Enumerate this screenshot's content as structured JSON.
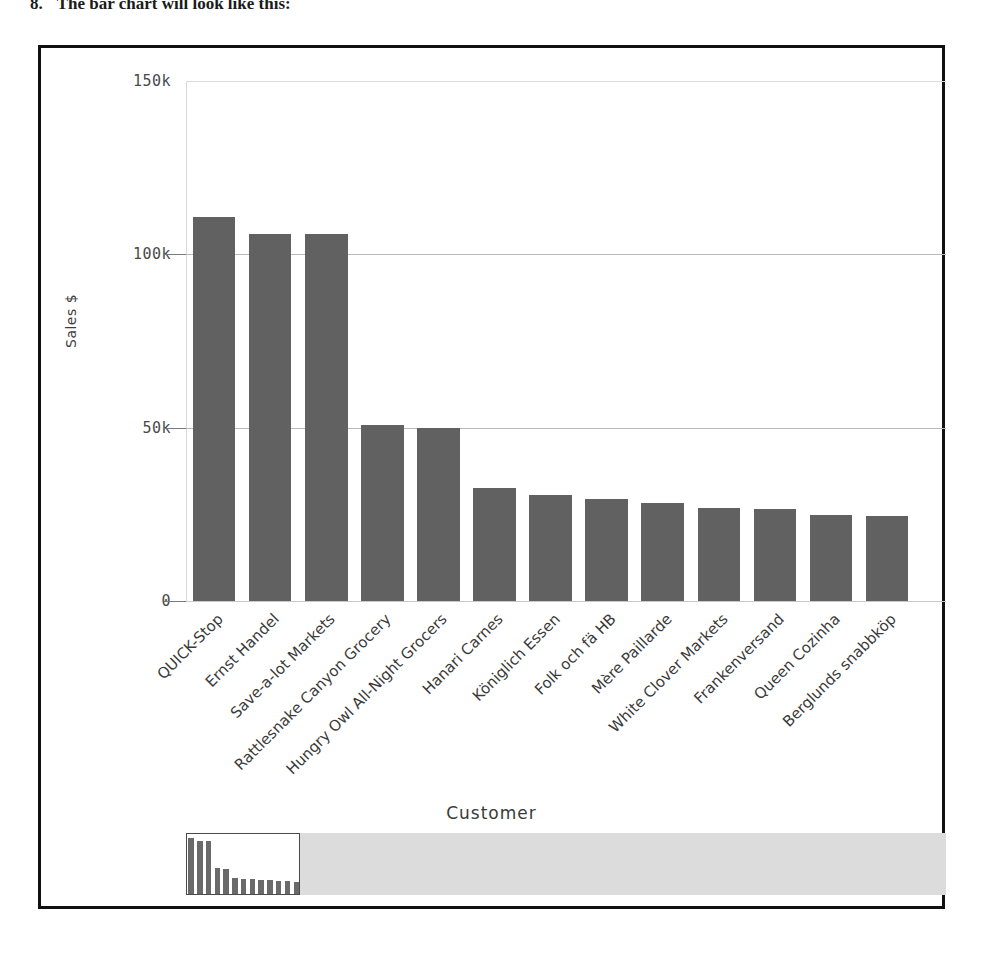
{
  "caption": {
    "number": "8.",
    "text": "The bar chart will look like this:"
  },
  "chart_data": {
    "type": "bar",
    "title": "",
    "xlabel": "Customer",
    "ylabel": "Sales $",
    "ylim": [
      0,
      150000
    ],
    "grid": true,
    "legend": "none",
    "ytick_labels": [
      "150k",
      "100k",
      "50k",
      "0"
    ],
    "ytick_values": [
      150000,
      100000,
      50000,
      0
    ],
    "bar_color": "#616161",
    "categories": [
      "QUICK-Stop",
      "Ernst Handel",
      "Save-a-lot Markets",
      "Rattlesnake Canyon Grocery",
      "Hungry Owl All-Night Grocers",
      "Hanari Carnes",
      "Königlich Essen",
      "Folk och fä HB",
      "Mère Paillarde",
      "White Clover Markets",
      "Frankenversand",
      "Queen Cozinha",
      "Berglunds snabbköp"
    ],
    "values": [
      110900,
      105900,
      105900,
      50800,
      49800,
      32700,
      30500,
      29300,
      28400,
      26800,
      26500,
      24900,
      24600
    ]
  },
  "range_selector": {
    "window_start_pct": 0,
    "window_end_pct": 15,
    "overview_values": [
      110900,
      105900,
      105900,
      50800,
      49800,
      32700,
      30500,
      29300,
      28400,
      26800,
      26500,
      24900,
      24600,
      24000,
      23500,
      23000,
      22400,
      21900,
      21300,
      20800,
      20200,
      19700,
      19100,
      18600,
      18000,
      17500,
      17000,
      16500,
      16000,
      15600,
      15100,
      14700,
      14200,
      13800,
      13400,
      13000,
      12600,
      12200,
      11800,
      11400,
      11000,
      10600,
      10200,
      9800,
      9400,
      9000,
      8600,
      8200,
      7800,
      7400
    ],
    "track_color": "#dcdcdc",
    "window_color": "#ffffff"
  }
}
